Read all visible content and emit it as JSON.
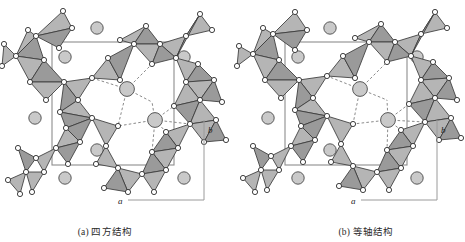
{
  "figure": {
    "type": "crystal-structure-projection-pair",
    "panels": [
      {
        "id": "a",
        "caption": "(a) 四方结构",
        "axes": {
          "horizontal": "a",
          "vertical": "b"
        }
      },
      {
        "id": "b",
        "caption": "(b) 等轴结构",
        "axes": {
          "horizontal": "a",
          "vertical": "b"
        }
      }
    ],
    "legend_semantics": {
      "tetrahedron": "gray filled triangle = coordination tetrahedron projection",
      "vertex_circle": "small white circle = oxygen / framework vertex atom",
      "large_circle": "large gray circle = interstitial cation",
      "dashed_line": "dashed line = cation-oxygen coordination bond",
      "rectangle": "thin gray rectangle = unit cell outline"
    }
  },
  "colors": {
    "tetra_fill": "#9a9a9a",
    "tetra_fill_light": "#b5b5b5",
    "tetra_edge": "#3a3a3a",
    "vertex_fill": "#ffffff",
    "vertex_edge": "#2b2b2b",
    "cation_fill": "#c9c9c9",
    "cation_edge": "#4a4a4a",
    "cell_line": "#8d8d8d",
    "dashed_line": "#7d7d7d",
    "axis_line": "#9a9a9a",
    "text": "#2a2a2a"
  },
  "panel_a": {
    "cell": {
      "x": 52,
      "y": 42,
      "w": 122,
      "h": 123
    },
    "axis": {
      "vertical": {
        "x": 204,
        "y1": 120,
        "y2": 200
      },
      "horizontal": {
        "y": 200,
        "x1": 128,
        "x2": 204
      },
      "label_b": {
        "x": 208,
        "y": 133,
        "text": "b"
      },
      "label_a": {
        "x": 118,
        "y": 204,
        "text": "a"
      }
    },
    "cations": [
      {
        "x": 97,
        "y": 28,
        "r": 6.2
      },
      {
        "x": 65,
        "y": 57,
        "r": 6.2
      },
      {
        "x": 184,
        "y": 57,
        "r": 6.2
      },
      {
        "x": 35,
        "y": 118,
        "r": 6.2
      },
      {
        "x": 97,
        "y": 150,
        "r": 6.2
      },
      {
        "x": 65,
        "y": 178,
        "r": 6.2
      },
      {
        "x": 184,
        "y": 178,
        "r": 6.2
      },
      {
        "x": 127,
        "y": 89,
        "r": 7.4
      },
      {
        "x": 155,
        "y": 120,
        "r": 7.4
      }
    ],
    "tetrahedra": [
      {
        "pts": "36,36 72,28 63,11",
        "shade": "mid"
      },
      {
        "pts": "36,36 72,28 59,48",
        "shade": "dark"
      },
      {
        "pts": "28,30 36,36 16,56",
        "shade": "mid"
      },
      {
        "pts": "16,56 36,36 44,60",
        "shade": "dark"
      },
      {
        "pts": "4,44 16,56 2,66",
        "shade": "mid"
      },
      {
        "pts": "16,56 44,60 30,82",
        "shade": "mid"
      },
      {
        "pts": "30,82 44,60 64,82",
        "shade": "dark"
      },
      {
        "pts": "30,82 64,82 46,100",
        "shade": "mid"
      },
      {
        "pts": "64,82 92,78 78,100",
        "shade": "mid"
      },
      {
        "pts": "64,82 78,100 60,112",
        "shade": "dark"
      },
      {
        "pts": "60,112 78,100 92,118",
        "shade": "mid"
      },
      {
        "pts": "60,112 92,118 66,128",
        "shade": "dark"
      },
      {
        "pts": "92,78 108,58 120,80",
        "shade": "mid"
      },
      {
        "pts": "108,58 134,44 120,80",
        "shade": "dark"
      },
      {
        "pts": "120,40 134,44 146,26",
        "shade": "mid"
      },
      {
        "pts": "134,44 146,26 160,44",
        "shade": "dark"
      },
      {
        "pts": "134,44 160,44 152,64",
        "shade": "mid"
      },
      {
        "pts": "160,44 186,36 176,58",
        "shade": "mid"
      },
      {
        "pts": "160,44 176,58 152,64",
        "shade": "dark"
      },
      {
        "pts": "186,36 212,30 200,14",
        "shade": "mid"
      },
      {
        "pts": "186,36 200,14 176,58",
        "shade": "dark"
      },
      {
        "pts": "176,58 198,64 186,82",
        "shade": "mid"
      },
      {
        "pts": "186,82 198,64 214,80",
        "shade": "dark"
      },
      {
        "pts": "186,82 214,80 200,100",
        "shade": "mid"
      },
      {
        "pts": "200,100 214,80 222,102",
        "shade": "dark"
      },
      {
        "pts": "186,82 200,100 174,106",
        "shade": "mid"
      },
      {
        "pts": "174,106 200,100 190,124",
        "shade": "dark"
      },
      {
        "pts": "190,124 200,100 216,120",
        "shade": "mid"
      },
      {
        "pts": "190,124 216,120 204,142",
        "shade": "mid"
      },
      {
        "pts": "204,142 216,120 226,140",
        "shade": "dark"
      },
      {
        "pts": "166,132 190,124 178,148",
        "shade": "mid"
      },
      {
        "pts": "166,132 178,148 152,152",
        "shade": "dark"
      },
      {
        "pts": "152,152 178,148 166,170",
        "shade": "mid"
      },
      {
        "pts": "152,152 166,170 142,174",
        "shade": "dark"
      },
      {
        "pts": "142,174 166,170 154,192",
        "shade": "mid"
      },
      {
        "pts": "118,168 142,174 128,192",
        "shade": "mid"
      },
      {
        "pts": "118,168 128,192 104,188",
        "shade": "dark"
      },
      {
        "pts": "92,118 118,126 106,146",
        "shade": "mid"
      },
      {
        "pts": "66,128 92,118 80,142",
        "shade": "dark"
      },
      {
        "pts": "66,128 80,142 56,148",
        "shade": "mid"
      },
      {
        "pts": "56,148 80,142 68,164",
        "shade": "dark"
      },
      {
        "pts": "36,158 56,148 44,172",
        "shade": "mid"
      },
      {
        "pts": "18,148 36,158 26,172",
        "shade": "dark"
      },
      {
        "pts": "26,172 44,172 32,192",
        "shade": "mid"
      },
      {
        "pts": "8,180 26,172 20,194",
        "shade": "mid"
      },
      {
        "pts": "106,146 118,168 96,164",
        "shade": "mid"
      }
    ],
    "vertices": [
      {
        "x": 36,
        "y": 36
      },
      {
        "x": 72,
        "y": 28
      },
      {
        "x": 63,
        "y": 11
      },
      {
        "x": 59,
        "y": 48
      },
      {
        "x": 28,
        "y": 30
      },
      {
        "x": 16,
        "y": 56
      },
      {
        "x": 44,
        "y": 60
      },
      {
        "x": 4,
        "y": 44
      },
      {
        "x": 2,
        "y": 66
      },
      {
        "x": 30,
        "y": 82
      },
      {
        "x": 64,
        "y": 82
      },
      {
        "x": 46,
        "y": 100
      },
      {
        "x": 92,
        "y": 78
      },
      {
        "x": 78,
        "y": 100
      },
      {
        "x": 60,
        "y": 112
      },
      {
        "x": 92,
        "y": 118
      },
      {
        "x": 66,
        "y": 128
      },
      {
        "x": 108,
        "y": 58
      },
      {
        "x": 120,
        "y": 80
      },
      {
        "x": 134,
        "y": 44
      },
      {
        "x": 120,
        "y": 40
      },
      {
        "x": 146,
        "y": 26
      },
      {
        "x": 160,
        "y": 44
      },
      {
        "x": 152,
        "y": 64
      },
      {
        "x": 186,
        "y": 36
      },
      {
        "x": 176,
        "y": 58
      },
      {
        "x": 212,
        "y": 30
      },
      {
        "x": 200,
        "y": 14
      },
      {
        "x": 198,
        "y": 64
      },
      {
        "x": 186,
        "y": 82
      },
      {
        "x": 214,
        "y": 80
      },
      {
        "x": 200,
        "y": 100
      },
      {
        "x": 222,
        "y": 102
      },
      {
        "x": 174,
        "y": 106
      },
      {
        "x": 190,
        "y": 124
      },
      {
        "x": 216,
        "y": 120
      },
      {
        "x": 204,
        "y": 142
      },
      {
        "x": 226,
        "y": 140
      },
      {
        "x": 166,
        "y": 132
      },
      {
        "x": 178,
        "y": 148
      },
      {
        "x": 152,
        "y": 152
      },
      {
        "x": 166,
        "y": 170
      },
      {
        "x": 142,
        "y": 174
      },
      {
        "x": 154,
        "y": 192
      },
      {
        "x": 118,
        "y": 168
      },
      {
        "x": 128,
        "y": 192
      },
      {
        "x": 104,
        "y": 188
      },
      {
        "x": 118,
        "y": 126
      },
      {
        "x": 106,
        "y": 146
      },
      {
        "x": 80,
        "y": 142
      },
      {
        "x": 56,
        "y": 148
      },
      {
        "x": 68,
        "y": 164
      },
      {
        "x": 36,
        "y": 158
      },
      {
        "x": 44,
        "y": 172
      },
      {
        "x": 18,
        "y": 148
      },
      {
        "x": 26,
        "y": 172
      },
      {
        "x": 32,
        "y": 192
      },
      {
        "x": 8,
        "y": 180
      },
      {
        "x": 20,
        "y": 194
      },
      {
        "x": 96,
        "y": 164
      }
    ],
    "bonds": [
      {
        "x1": 127,
        "y1": 89,
        "x2": 108,
        "y2": 58
      },
      {
        "x1": 127,
        "y1": 89,
        "x2": 152,
        "y2": 64
      },
      {
        "x1": 127,
        "y1": 89,
        "x2": 92,
        "y2": 78
      },
      {
        "x1": 127,
        "y1": 89,
        "x2": 120,
        "y2": 80
      },
      {
        "x1": 127,
        "y1": 89,
        "x2": 118,
        "y2": 126
      },
      {
        "x1": 127,
        "y1": 89,
        "x2": 152,
        "y2": 102
      },
      {
        "x1": 155,
        "y1": 120,
        "x2": 174,
        "y2": 106
      },
      {
        "x1": 155,
        "y1": 120,
        "x2": 166,
        "y2": 132
      },
      {
        "x1": 155,
        "y1": 120,
        "x2": 118,
        "y2": 126
      },
      {
        "x1": 155,
        "y1": 120,
        "x2": 152,
        "y2": 152
      },
      {
        "x1": 155,
        "y1": 120,
        "x2": 190,
        "y2": 124
      },
      {
        "x1": 155,
        "y1": 120,
        "x2": 152,
        "y2": 102
      }
    ]
  },
  "panel_b": {
    "cell": {
      "x": 52,
      "y": 42,
      "w": 122,
      "h": 123
    },
    "axis": {
      "vertical": {
        "x": 204,
        "y1": 120,
        "y2": 200
      },
      "horizontal": {
        "y": 200,
        "x1": 128,
        "x2": 204
      },
      "label_b": {
        "x": 208,
        "y": 133,
        "text": "b"
      },
      "label_a": {
        "x": 118,
        "y": 204,
        "text": "a"
      }
    },
    "cations": [
      {
        "x": 97,
        "y": 28,
        "r": 6.2
      },
      {
        "x": 65,
        "y": 57,
        "r": 6.2
      },
      {
        "x": 184,
        "y": 57,
        "r": 6.2
      },
      {
        "x": 35,
        "y": 118,
        "r": 6.2
      },
      {
        "x": 97,
        "y": 150,
        "r": 6.2
      },
      {
        "x": 65,
        "y": 178,
        "r": 6.2
      },
      {
        "x": 184,
        "y": 178,
        "r": 6.2
      },
      {
        "x": 127,
        "y": 89,
        "r": 7.4
      },
      {
        "x": 155,
        "y": 120,
        "r": 7.4
      }
    ],
    "tetrahedra": [
      {
        "pts": "40,34 74,30 62,12",
        "shade": "mid"
      },
      {
        "pts": "40,34 74,30 62,50",
        "shade": "dark"
      },
      {
        "pts": "30,28 40,34 20,54",
        "shade": "mid"
      },
      {
        "pts": "20,54 40,34 46,60",
        "shade": "dark"
      },
      {
        "pts": "6,46 20,54 4,66",
        "shade": "mid"
      },
      {
        "pts": "20,54 46,60 32,80",
        "shade": "mid"
      },
      {
        "pts": "32,80 46,60 66,80",
        "shade": "dark"
      },
      {
        "pts": "32,80 66,80 48,98",
        "shade": "mid"
      },
      {
        "pts": "66,80 94,76 80,98",
        "shade": "mid"
      },
      {
        "pts": "66,80 80,98 62,110",
        "shade": "dark"
      },
      {
        "pts": "62,110 80,98 94,116",
        "shade": "mid"
      },
      {
        "pts": "62,110 94,116 68,126",
        "shade": "dark"
      },
      {
        "pts": "94,76 110,56 122,78",
        "shade": "mid"
      },
      {
        "pts": "110,56 136,42 122,78",
        "shade": "dark"
      },
      {
        "pts": "122,38 136,42 148,24",
        "shade": "mid"
      },
      {
        "pts": "136,42 148,24 162,42",
        "shade": "dark"
      },
      {
        "pts": "136,42 162,42 154,62",
        "shade": "mid"
      },
      {
        "pts": "162,42 188,34 178,56",
        "shade": "mid"
      },
      {
        "pts": "162,42 178,56 154,62",
        "shade": "dark"
      },
      {
        "pts": "188,34 214,28 202,12",
        "shade": "mid"
      },
      {
        "pts": "188,34 202,12 178,56",
        "shade": "dark"
      },
      {
        "pts": "178,56 200,62 188,80",
        "shade": "mid"
      },
      {
        "pts": "188,80 200,62 216,78",
        "shade": "dark"
      },
      {
        "pts": "188,80 216,78 202,98",
        "shade": "mid"
      },
      {
        "pts": "202,98 216,78 224,100",
        "shade": "dark"
      },
      {
        "pts": "188,80 202,98 176,104",
        "shade": "mid"
      },
      {
        "pts": "176,104 202,98 192,122",
        "shade": "dark"
      },
      {
        "pts": "192,122 202,98 218,118",
        "shade": "mid"
      },
      {
        "pts": "192,122 218,118 206,140",
        "shade": "mid"
      },
      {
        "pts": "206,140 218,118 228,138",
        "shade": "dark"
      },
      {
        "pts": "168,130 192,122 180,146",
        "shade": "mid"
      },
      {
        "pts": "168,130 180,146 154,150",
        "shade": "dark"
      },
      {
        "pts": "154,150 180,146 168,168",
        "shade": "mid"
      },
      {
        "pts": "154,150 168,168 144,172",
        "shade": "dark"
      },
      {
        "pts": "144,172 168,168 156,190",
        "shade": "mid"
      },
      {
        "pts": "120,166 144,172 130,190",
        "shade": "mid"
      },
      {
        "pts": "120,166 130,190 106,186",
        "shade": "dark"
      },
      {
        "pts": "94,116 120,124 108,144",
        "shade": "mid"
      },
      {
        "pts": "68,126 94,116 82,140",
        "shade": "dark"
      },
      {
        "pts": "68,126 82,140 58,146",
        "shade": "mid"
      },
      {
        "pts": "58,146 82,140 70,162",
        "shade": "dark"
      },
      {
        "pts": "38,156 58,146 46,170",
        "shade": "mid"
      },
      {
        "pts": "20,146 38,156 28,170",
        "shade": "dark"
      },
      {
        "pts": "28,170 46,170 34,190",
        "shade": "mid"
      },
      {
        "pts": "10,178 28,170 22,192",
        "shade": "mid"
      },
      {
        "pts": "108,144 120,166 98,162",
        "shade": "mid"
      }
    ],
    "vertices": [
      {
        "x": 40,
        "y": 34
      },
      {
        "x": 74,
        "y": 30
      },
      {
        "x": 62,
        "y": 12
      },
      {
        "x": 62,
        "y": 50
      },
      {
        "x": 30,
        "y": 28
      },
      {
        "x": 20,
        "y": 54
      },
      {
        "x": 46,
        "y": 60
      },
      {
        "x": 6,
        "y": 46
      },
      {
        "x": 4,
        "y": 66
      },
      {
        "x": 32,
        "y": 80
      },
      {
        "x": 66,
        "y": 80
      },
      {
        "x": 48,
        "y": 98
      },
      {
        "x": 94,
        "y": 76
      },
      {
        "x": 80,
        "y": 98
      },
      {
        "x": 62,
        "y": 110
      },
      {
        "x": 94,
        "y": 116
      },
      {
        "x": 68,
        "y": 126
      },
      {
        "x": 110,
        "y": 56
      },
      {
        "x": 122,
        "y": 78
      },
      {
        "x": 136,
        "y": 42
      },
      {
        "x": 122,
        "y": 38
      },
      {
        "x": 148,
        "y": 24
      },
      {
        "x": 162,
        "y": 42
      },
      {
        "x": 154,
        "y": 62
      },
      {
        "x": 188,
        "y": 34
      },
      {
        "x": 178,
        "y": 56
      },
      {
        "x": 214,
        "y": 28
      },
      {
        "x": 202,
        "y": 12
      },
      {
        "x": 200,
        "y": 62
      },
      {
        "x": 188,
        "y": 80
      },
      {
        "x": 216,
        "y": 78
      },
      {
        "x": 202,
        "y": 98
      },
      {
        "x": 224,
        "y": 100
      },
      {
        "x": 176,
        "y": 104
      },
      {
        "x": 192,
        "y": 122
      },
      {
        "x": 218,
        "y": 118
      },
      {
        "x": 206,
        "y": 140
      },
      {
        "x": 228,
        "y": 138
      },
      {
        "x": 168,
        "y": 130
      },
      {
        "x": 180,
        "y": 146
      },
      {
        "x": 154,
        "y": 150
      },
      {
        "x": 168,
        "y": 168
      },
      {
        "x": 144,
        "y": 172
      },
      {
        "x": 156,
        "y": 190
      },
      {
        "x": 120,
        "y": 166
      },
      {
        "x": 130,
        "y": 190
      },
      {
        "x": 106,
        "y": 186
      },
      {
        "x": 120,
        "y": 124
      },
      {
        "x": 108,
        "y": 144
      },
      {
        "x": 82,
        "y": 140
      },
      {
        "x": 58,
        "y": 146
      },
      {
        "x": 70,
        "y": 162
      },
      {
        "x": 38,
        "y": 156
      },
      {
        "x": 46,
        "y": 170
      },
      {
        "x": 20,
        "y": 146
      },
      {
        "x": 28,
        "y": 170
      },
      {
        "x": 34,
        "y": 190
      },
      {
        "x": 10,
        "y": 178
      },
      {
        "x": 22,
        "y": 192
      },
      {
        "x": 98,
        "y": 162
      }
    ],
    "bonds": [
      {
        "x1": 127,
        "y1": 89,
        "x2": 110,
        "y2": 56
      },
      {
        "x1": 127,
        "y1": 89,
        "x2": 154,
        "y2": 62
      },
      {
        "x1": 127,
        "y1": 89,
        "x2": 94,
        "y2": 76
      },
      {
        "x1": 127,
        "y1": 89,
        "x2": 122,
        "y2": 78
      },
      {
        "x1": 127,
        "y1": 89,
        "x2": 120,
        "y2": 124
      },
      {
        "x1": 127,
        "y1": 89,
        "x2": 154,
        "y2": 100
      },
      {
        "x1": 155,
        "y1": 120,
        "x2": 176,
        "y2": 104
      },
      {
        "x1": 155,
        "y1": 120,
        "x2": 168,
        "y2": 130
      },
      {
        "x1": 155,
        "y1": 120,
        "x2": 120,
        "y2": 124
      },
      {
        "x1": 155,
        "y1": 120,
        "x2": 154,
        "y2": 150
      },
      {
        "x1": 155,
        "y1": 120,
        "x2": 192,
        "y2": 122
      },
      {
        "x1": 155,
        "y1": 120,
        "x2": 154,
        "y2": 100
      }
    ]
  }
}
